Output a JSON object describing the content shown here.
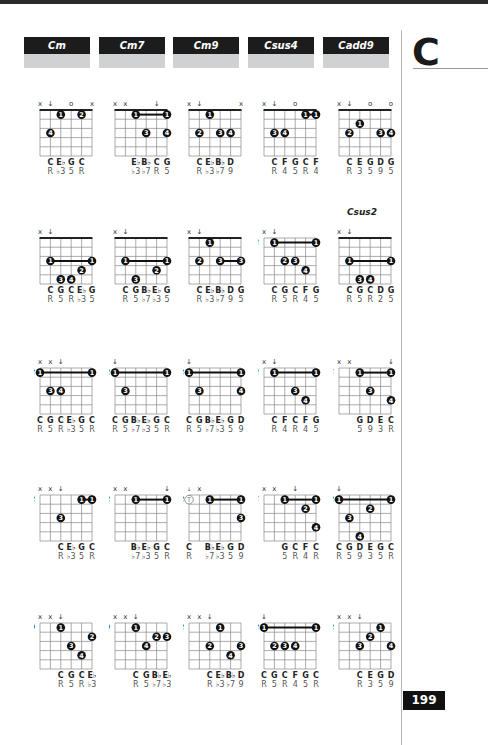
{
  "page": {
    "key_letter": "C",
    "page_number": "199"
  },
  "headers": [
    {
      "label": "Cm"
    },
    {
      "label": "Cm7"
    },
    {
      "label": "Cm9"
    },
    {
      "label": "Csus4"
    },
    {
      "label": "Cadd9"
    }
  ],
  "columns_x": [
    34,
    109,
    183,
    258,
    333
  ],
  "rows_y": [
    92,
    220,
    350,
    477,
    605
  ],
  "chords": [
    {
      "id": "cm-r1",
      "col": 0,
      "row": 0,
      "fret": "",
      "nut": true,
      "top": [
        "x",
        "↓",
        "",
        "o",
        "",
        "x"
      ],
      "dots": [
        {
          "s": 2,
          "f": 1,
          "n": "1"
        },
        {
          "s": 4,
          "f": 1,
          "n": "2"
        },
        {
          "s": 1,
          "f": 3,
          "n": "4"
        }
      ],
      "barres": [],
      "notes": [
        "",
        "C",
        "E♭",
        "G",
        "C",
        ""
      ],
      "degrees": [
        "",
        "R",
        "♭3",
        "5",
        "R",
        ""
      ]
    },
    {
      "id": "cm7-r1",
      "col": 1,
      "row": 0,
      "fret": "",
      "nut": true,
      "top": [
        "x",
        "x",
        "",
        "",
        "↓",
        ""
      ],
      "dots": [
        {
          "s": 3,
          "f": 3,
          "n": "3"
        },
        {
          "s": 5,
          "f": 3,
          "n": "4"
        }
      ],
      "barres": [
        {
          "from": 2,
          "to": 5,
          "f": 1,
          "n": "1"
        }
      ],
      "notes": [
        "",
        "",
        "E♭",
        "B♭",
        "C",
        "G"
      ],
      "degrees": [
        "",
        "",
        "♭3",
        "♭7",
        "R",
        "5"
      ]
    },
    {
      "id": "cm9-r1",
      "col": 2,
      "row": 0,
      "fret": "",
      "nut": true,
      "top": [
        "x",
        "↓",
        "",
        "",
        "",
        "x"
      ],
      "dots": [
        {
          "s": 2,
          "f": 1,
          "n": "1"
        },
        {
          "s": 1,
          "f": 3,
          "n": "2"
        },
        {
          "s": 3,
          "f": 3,
          "n": "3"
        },
        {
          "s": 4,
          "f": 3,
          "n": "4"
        }
      ],
      "barres": [],
      "notes": [
        "",
        "C",
        "E♭",
        "B♭",
        "D",
        ""
      ],
      "degrees": [
        "",
        "R",
        "♭3",
        "♭7",
        "9",
        ""
      ]
    },
    {
      "id": "csus4-r1",
      "col": 3,
      "row": 0,
      "fret": "",
      "nut": true,
      "top": [
        "x",
        "↓",
        "",
        "o",
        "",
        ""
      ],
      "dots": [
        {
          "s": 1,
          "f": 3,
          "n": "3"
        },
        {
          "s": 2,
          "f": 3,
          "n": "4"
        }
      ],
      "barres": [
        {
          "from": 4,
          "to": 5,
          "f": 1,
          "n": "1"
        }
      ],
      "notes": [
        "",
        "C",
        "F",
        "G",
        "C",
        "F"
      ],
      "degrees": [
        "",
        "R",
        "4",
        "5",
        "R",
        "4"
      ]
    },
    {
      "id": "cadd9-r1",
      "col": 4,
      "row": 0,
      "fret": "",
      "nut": true,
      "top": [
        "x",
        "↓",
        "",
        "o",
        "",
        "o"
      ],
      "dots": [
        {
          "s": 2,
          "f": 2,
          "n": "1"
        },
        {
          "s": 1,
          "f": 3,
          "n": "2"
        },
        {
          "s": 4,
          "f": 3,
          "n": "3"
        },
        {
          "s": 5,
          "f": 3,
          "n": "4"
        }
      ],
      "barres": [],
      "notes": [
        "",
        "C",
        "E",
        "G",
        "D",
        "G"
      ],
      "degrees": [
        "",
        "R",
        "3",
        "5",
        "9",
        "5"
      ]
    },
    {
      "id": "cm-r2",
      "col": 0,
      "row": 1,
      "fret": "",
      "nut": true,
      "top": [
        "x",
        "↓",
        "",
        "",
        "",
        ""
      ],
      "dots": [
        {
          "s": 4,
          "f": 4,
          "n": "2"
        },
        {
          "s": 2,
          "f": 5,
          "n": "3"
        },
        {
          "s": 3,
          "f": 5,
          "n": "4"
        }
      ],
      "barres": [
        {
          "from": 1,
          "to": 5,
          "f": 3,
          "n": "1"
        }
      ],
      "notes": [
        "",
        "C",
        "G",
        "C",
        "E♭",
        "G"
      ],
      "degrees": [
        "",
        "R",
        "5",
        "R",
        "♭3",
        "5"
      ]
    },
    {
      "id": "cm7-r2",
      "col": 1,
      "row": 1,
      "fret": "",
      "nut": true,
      "top": [
        "x",
        "↓",
        "",
        "",
        "",
        ""
      ],
      "dots": [
        {
          "s": 4,
          "f": 4,
          "n": "2"
        },
        {
          "s": 2,
          "f": 5,
          "n": "3"
        }
      ],
      "barres": [
        {
          "from": 1,
          "to": 5,
          "f": 3,
          "n": "1"
        }
      ],
      "notes": [
        "",
        "C",
        "G",
        "B♭",
        "E♭",
        "G"
      ],
      "degrees": [
        "",
        "R",
        "5",
        "♭7",
        "♭3",
        "5"
      ]
    },
    {
      "id": "cm9-r2",
      "col": 2,
      "row": 1,
      "fret": "",
      "nut": true,
      "top": [
        "x",
        "↓",
        "",
        "",
        "",
        ""
      ],
      "dots": [
        {
          "s": 2,
          "f": 1,
          "n": "1"
        },
        {
          "s": 1,
          "f": 3,
          "n": "2"
        }
      ],
      "barres": [
        {
          "from": 3,
          "to": 5,
          "f": 3,
          "n": "3"
        }
      ],
      "notes": [
        "",
        "C",
        "E♭",
        "B♭",
        "D",
        "G"
      ],
      "degrees": [
        "",
        "R",
        "♭3",
        "♭7",
        "9",
        "5"
      ]
    },
    {
      "id": "csus4-r2",
      "col": 3,
      "row": 1,
      "fret": "3",
      "nut": false,
      "top": [
        "x",
        "↓",
        "",
        "",
        "",
        ""
      ],
      "dots": [
        {
          "s": 2,
          "f": 3,
          "n": "2"
        },
        {
          "s": 3,
          "f": 3,
          "n": "3"
        },
        {
          "s": 4,
          "f": 4,
          "n": "4"
        }
      ],
      "barres": [
        {
          "from": 1,
          "to": 5,
          "f": 1,
          "n": "1"
        }
      ],
      "notes": [
        "",
        "C",
        "G",
        "C",
        "F",
        "G"
      ],
      "degrees": [
        "",
        "R",
        "5",
        "R",
        "4",
        "5"
      ]
    },
    {
      "id": "csus2-r2",
      "col": 4,
      "row": 1,
      "fret": "",
      "nut": true,
      "sublabel": "Csus2",
      "top": [
        "x",
        "↓",
        "",
        "",
        "",
        ""
      ],
      "dots": [
        {
          "s": 2,
          "f": 5,
          "n": "3"
        },
        {
          "s": 3,
          "f": 5,
          "n": "4"
        }
      ],
      "barres": [
        {
          "from": 1,
          "to": 5,
          "f": 3,
          "n": "1"
        }
      ],
      "notes": [
        "",
        "C",
        "G",
        "C",
        "D",
        "G"
      ],
      "degrees": [
        "",
        "R",
        "5",
        "R",
        "2",
        "5"
      ]
    },
    {
      "id": "cm-r3",
      "col": 0,
      "row": 2,
      "fret": "8",
      "nut": false,
      "top": [
        "x",
        "x",
        "↓",
        "",
        "",
        ""
      ],
      "dots": [
        {
          "s": 1,
          "f": 3,
          "n": "3"
        },
        {
          "s": 2,
          "f": 3,
          "n": "4"
        }
      ],
      "barres": [
        {
          "from": 0,
          "to": 5,
          "f": 1,
          "n": "1"
        }
      ],
      "notes": [
        "C",
        "G",
        "C",
        "E♭",
        "G",
        "C"
      ],
      "degrees": [
        "R",
        "5",
        "R",
        "♭3",
        "5",
        "R"
      ]
    },
    {
      "id": "cm7-r3",
      "col": 1,
      "row": 2,
      "fret": "8",
      "nut": false,
      "top": [
        "↓",
        "",
        "",
        "",
        "",
        ""
      ],
      "dots": [
        {
          "s": 1,
          "f": 3,
          "n": "3"
        }
      ],
      "barres": [
        {
          "from": 0,
          "to": 5,
          "f": 1,
          "n": "1"
        }
      ],
      "notes": [
        "C",
        "G",
        "B♭",
        "E♭",
        "G",
        "C"
      ],
      "degrees": [
        "R",
        "5",
        "♭7",
        "♭3",
        "5",
        "R"
      ]
    },
    {
      "id": "cm9-r3",
      "col": 2,
      "row": 2,
      "fret": "8",
      "nut": false,
      "top": [
        "↓",
        "",
        "",
        "",
        "",
        ""
      ],
      "dots": [
        {
          "s": 1,
          "f": 3,
          "n": "3"
        },
        {
          "s": 5,
          "f": 3,
          "n": "4"
        }
      ],
      "barres": [
        {
          "from": 0,
          "to": 5,
          "f": 1,
          "n": "1"
        }
      ],
      "notes": [
        "C",
        "G",
        "B♭",
        "E♭",
        "G",
        "D"
      ],
      "degrees": [
        "R",
        "5",
        "♭7",
        "♭3",
        "5",
        "9"
      ]
    },
    {
      "id": "csus4-r3",
      "col": 3,
      "row": 2,
      "fret": "3",
      "nut": false,
      "top": [
        "x",
        "↓",
        "",
        "",
        "",
        ""
      ],
      "dots": [
        {
          "s": 3,
          "f": 3,
          "n": "3"
        },
        {
          "s": 4,
          "f": 4,
          "n": "4"
        }
      ],
      "barres": [
        {
          "from": 1,
          "to": 5,
          "f": 1,
          "n": "1"
        }
      ],
      "notes": [
        "",
        "C",
        "F",
        "C",
        "F",
        "G"
      ],
      "degrees": [
        "",
        "R",
        "4",
        "R",
        "4",
        "5"
      ]
    },
    {
      "id": "cadd9-r3",
      "col": 4,
      "row": 2,
      "fret": "5",
      "nut": false,
      "top": [
        "x",
        "x",
        "",
        "",
        "",
        "↓"
      ],
      "dots": [
        {
          "s": 3,
          "f": 3,
          "n": "3"
        },
        {
          "s": 5,
          "f": 4,
          "n": "4"
        }
      ],
      "barres": [
        {
          "from": 2,
          "to": 5,
          "f": 1,
          "n": "1"
        }
      ],
      "notes": [
        "",
        "",
        "G",
        "D",
        "E",
        "C"
      ],
      "degrees": [
        "",
        "",
        "5",
        "9",
        "3",
        "R"
      ]
    },
    {
      "id": "cm-r4",
      "col": 0,
      "row": 3,
      "fret": "8",
      "nut": false,
      "top": [
        "x",
        "x",
        "↓",
        "",
        "",
        ""
      ],
      "dots": [
        {
          "s": 2,
          "f": 3,
          "n": "3"
        }
      ],
      "barres": [
        {
          "from": 4,
          "to": 5,
          "f": 1,
          "n": "1"
        }
      ],
      "notes": [
        "",
        "",
        "C",
        "E♭",
        "G",
        "C"
      ],
      "degrees": [
        "",
        "",
        "R",
        "♭3",
        "5",
        "R"
      ]
    },
    {
      "id": "cm7-r4",
      "col": 1,
      "row": 3,
      "fret": "8",
      "nut": false,
      "top": [
        "x",
        "x",
        "",
        "",
        "",
        "↓"
      ],
      "dots": [],
      "barres": [
        {
          "from": 2,
          "to": 5,
          "f": 1,
          "n": "1"
        }
      ],
      "notes": [
        "",
        "",
        "B♭",
        "E♭",
        "G",
        "C"
      ],
      "degrees": [
        "",
        "",
        "♭7",
        "♭3",
        "5",
        "R"
      ]
    },
    {
      "id": "cm9-r4",
      "col": 2,
      "row": 3,
      "fret": "8",
      "nut": false,
      "top": [
        "↓ (x)",
        "x",
        "",
        "",
        "",
        ""
      ],
      "dots": [
        {
          "s": 0,
          "f": 1,
          "n": "T",
          "thumb": true
        },
        {
          "s": 5,
          "f": 3,
          "n": "3"
        }
      ],
      "barres": [
        {
          "from": 2,
          "to": 5,
          "f": 1,
          "n": "1"
        }
      ],
      "notes": [
        "C",
        "",
        "B♭",
        "E♭",
        "G",
        "D"
      ],
      "degrees": [
        "R",
        "",
        "♭7",
        "♭3",
        "5",
        "9"
      ]
    },
    {
      "id": "csus4-r4",
      "col": 3,
      "row": 3,
      "fret": "5",
      "nut": false,
      "top": [
        "x",
        "x",
        "",
        "↓",
        "",
        ""
      ],
      "dots": [
        {
          "s": 4,
          "f": 2,
          "n": "2"
        },
        {
          "s": 5,
          "f": 4,
          "n": "4"
        }
      ],
      "barres": [
        {
          "from": 2,
          "to": 5,
          "f": 1,
          "n": "1"
        }
      ],
      "notes": [
        "",
        "",
        "G",
        "C",
        "F",
        "C"
      ],
      "degrees": [
        "",
        "",
        "5",
        "R",
        "4",
        "R"
      ]
    },
    {
      "id": "cadd9-r4",
      "col": 4,
      "row": 3,
      "fret": "8",
      "nut": false,
      "top": [
        "↓",
        "",
        "",
        "",
        "",
        ""
      ],
      "dots": [
        {
          "s": 3,
          "f": 2,
          "n": "2"
        },
        {
          "s": 1,
          "f": 3,
          "n": "3"
        },
        {
          "s": 2,
          "f": 5,
          "n": "4"
        }
      ],
      "barres": [
        {
          "from": 0,
          "to": 5,
          "f": 1,
          "n": "1"
        }
      ],
      "notes": [
        "C",
        "G",
        "D",
        "E",
        "G",
        "C"
      ],
      "degrees": [
        "R",
        "5",
        "9",
        "3",
        "5",
        "R"
      ]
    },
    {
      "id": "cm-r5",
      "col": 0,
      "row": 4,
      "fret": "10",
      "nut": false,
      "top": [
        "x",
        "x",
        "↓",
        "",
        "",
        ""
      ],
      "dots": [
        {
          "s": 2,
          "f": 1,
          "n": "1"
        },
        {
          "s": 5,
          "f": 2,
          "n": "2"
        },
        {
          "s": 3,
          "f": 3,
          "n": "3"
        },
        {
          "s": 4,
          "f": 4,
          "n": "4"
        }
      ],
      "barres": [],
      "notes": [
        "",
        "",
        "C",
        "G",
        "C",
        "E♭"
      ],
      "degrees": [
        "",
        "",
        "R",
        "5",
        "R",
        "♭3"
      ]
    },
    {
      "id": "cm7-r5",
      "col": 1,
      "row": 4,
      "fret": "10",
      "nut": false,
      "top": [
        "x",
        "x",
        "↓",
        "",
        "",
        ""
      ],
      "dots": [
        {
          "s": 2,
          "f": 1,
          "n": "1"
        },
        {
          "s": 4,
          "f": 2,
          "n": "2"
        },
        {
          "s": 5,
          "f": 2,
          "n": "3"
        },
        {
          "s": 3,
          "f": 3,
          "n": "4"
        }
      ],
      "barres": [],
      "notes": [
        "",
        "",
        "C",
        "G",
        "B♭",
        "E♭"
      ],
      "degrees": [
        "",
        "",
        "R",
        "5",
        "♭7",
        "♭3"
      ]
    },
    {
      "id": "cm9-r5",
      "col": 2,
      "row": 4,
      "fret": "8",
      "nut": false,
      "top": [
        "x",
        "x",
        "↓",
        "",
        "",
        ""
      ],
      "dots": [
        {
          "s": 3,
          "f": 1,
          "n": "1"
        },
        {
          "s": 2,
          "f": 3,
          "n": "2"
        },
        {
          "s": 5,
          "f": 3,
          "n": "3"
        },
        {
          "s": 4,
          "f": 4,
          "n": "4"
        }
      ],
      "barres": [],
      "notes": [
        "",
        "",
        "C",
        "E♭",
        "B♭",
        "D"
      ],
      "degrees": [
        "",
        "",
        "R",
        "♭3",
        "♭7",
        "9"
      ]
    },
    {
      "id": "csus4-r5",
      "col": 3,
      "row": 4,
      "fret": "8",
      "nut": false,
      "top": [
        "↓",
        "",
        "",
        "",
        "",
        ""
      ],
      "dots": [
        {
          "s": 1,
          "f": 3,
          "n": "2"
        },
        {
          "s": 2,
          "f": 3,
          "n": "3"
        },
        {
          "s": 3,
          "f": 3,
          "n": "4"
        }
      ],
      "barres": [
        {
          "from": 0,
          "to": 5,
          "f": 1,
          "n": "1"
        }
      ],
      "notes": [
        "C",
        "G",
        "C",
        "F",
        "G",
        "C"
      ],
      "degrees": [
        "R",
        "5",
        "R",
        "4",
        "5",
        "R"
      ]
    },
    {
      "id": "cadd9-r5",
      "col": 4,
      "row": 4,
      "fret": "8",
      "nut": false,
      "top": [
        "x",
        "x",
        "↓",
        "",
        "",
        ""
      ],
      "dots": [
        {
          "s": 4,
          "f": 1,
          "n": "1"
        },
        {
          "s": 3,
          "f": 2,
          "n": "2"
        },
        {
          "s": 2,
          "f": 3,
          "n": "3"
        },
        {
          "s": 5,
          "f": 3,
          "n": "4"
        }
      ],
      "barres": [],
      "notes": [
        "",
        "",
        "C",
        "E",
        "G",
        "D"
      ],
      "degrees": [
        "",
        "",
        "R",
        "3",
        "5",
        "9"
      ]
    }
  ]
}
